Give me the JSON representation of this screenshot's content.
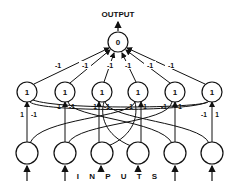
{
  "title": "OUTPUT",
  "inputs_label": "I N P U T S",
  "output_node": {
    "label": "0",
    "x": 118,
    "y": 42
  },
  "hidden_nodes": [
    {
      "label": "1",
      "x": 27
    },
    {
      "label": "1",
      "x": 65
    },
    {
      "label": "1",
      "x": 102
    },
    {
      "label": "1",
      "x": 138
    },
    {
      "label": "1",
      "x": 175
    },
    {
      "label": "1",
      "x": 212
    }
  ],
  "hidden_to_output_weights": [
    "-1",
    "-1",
    "-1",
    "-1",
    "-1",
    "-1"
  ],
  "input_to_hidden_weights": [
    {
      "direct": "1",
      "cross": "-1"
    },
    {
      "direct": "1",
      "cross": "-1"
    },
    {
      "direct": "1",
      "cross": "-1"
    },
    {
      "cross": "-1",
      "direct": "1"
    },
    {
      "cross": "-1",
      "direct": "1"
    },
    {
      "cross": "-1",
      "direct": "1"
    }
  ],
  "colors": {
    "stroke": "#111111",
    "background": "#ffffff"
  }
}
